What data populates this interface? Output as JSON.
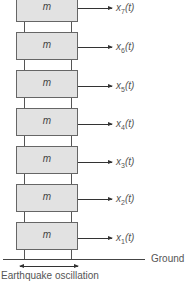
{
  "diagram": {
    "floors": [
      {
        "mass_label": "m",
        "displacement_var": "x",
        "index": "7",
        "suffix": "(t)"
      },
      {
        "mass_label": "m",
        "displacement_var": "x",
        "index": "6",
        "suffix": "(t)"
      },
      {
        "mass_label": "m",
        "displacement_var": "x",
        "index": "5",
        "suffix": "(t)"
      },
      {
        "mass_label": "m",
        "displacement_var": "x",
        "index": "4",
        "suffix": "(t)"
      },
      {
        "mass_label": "m",
        "displacement_var": "x",
        "index": "3",
        "suffix": "(t)"
      },
      {
        "mass_label": "m",
        "displacement_var": "x",
        "index": "2",
        "suffix": "(t)"
      },
      {
        "mass_label": "m",
        "displacement_var": "x",
        "index": "1",
        "suffix": "(t)"
      }
    ],
    "ground_label": "Ground",
    "excitation_label": "Earthquake oscillation",
    "colors": {
      "mass_fill": "#e2e2e2",
      "lines": "#555555"
    }
  }
}
